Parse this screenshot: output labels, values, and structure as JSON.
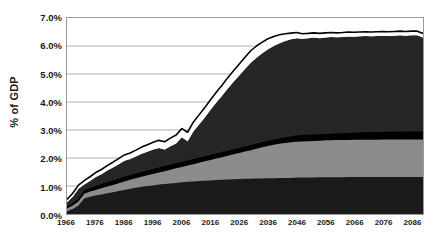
{
  "chart_data": {
    "type": "area",
    "title": "",
    "xlabel": "",
    "ylabel": "% of GDP",
    "xlim": [
      1966,
      2090
    ],
    "ylim": [
      0,
      0.07
    ],
    "grid": true,
    "legend": "none",
    "stacked": true,
    "y_tick_labels": [
      "7.0%",
      "6.0%",
      "5.0%",
      "4.0%",
      "3.0%",
      "2.0%",
      "1.0%",
      "0.0%"
    ],
    "y_tick_values": [
      7.0,
      6.0,
      5.0,
      4.0,
      3.0,
      2.0,
      1.0,
      0.0
    ],
    "x_tick_labels": [
      "1966",
      "1976",
      "1986",
      "1996",
      "2006",
      "2016",
      "2026",
      "2036",
      "2046",
      "2056",
      "2066",
      "2076",
      "2086"
    ],
    "x_tick_values": [
      1966,
      1976,
      1986,
      1996,
      2006,
      2016,
      2026,
      2036,
      2046,
      2056,
      2066,
      2076,
      2086
    ],
    "colors": {
      "layer1": "#1a1a1a",
      "layer2": "#8c8c8c",
      "layer3": "#000000",
      "layer4": "#262626",
      "gap": "#ffffff",
      "outline": "#000000",
      "gridline": "#9a9a9a",
      "axis": "#9a9a9a",
      "text": "#1a1a1a",
      "background": "#ffffff"
    },
    "x": [
      1966,
      1968,
      1970,
      1972,
      1974,
      1976,
      1978,
      1980,
      1982,
      1984,
      1986,
      1988,
      1990,
      1992,
      1994,
      1996,
      1998,
      2000,
      2002,
      2004,
      2006,
      2008,
      2010,
      2012,
      2014,
      2016,
      2018,
      2020,
      2022,
      2024,
      2026,
      2028,
      2030,
      2032,
      2034,
      2036,
      2038,
      2040,
      2042,
      2044,
      2046,
      2048,
      2050,
      2052,
      2054,
      2056,
      2058,
      2060,
      2062,
      2064,
      2066,
      2068,
      2070,
      2072,
      2074,
      2076,
      2078,
      2080,
      2082,
      2084,
      2086,
      2088,
      2090
    ],
    "series": [
      {
        "name": "layer1",
        "stack_top_values": [
          0.1,
          0.18,
          0.3,
          0.55,
          0.62,
          0.66,
          0.7,
          0.74,
          0.78,
          0.82,
          0.86,
          0.9,
          0.94,
          0.97,
          1.0,
          1.02,
          1.05,
          1.07,
          1.09,
          1.11,
          1.13,
          1.15,
          1.16,
          1.18,
          1.19,
          1.2,
          1.21,
          1.22,
          1.23,
          1.24,
          1.25,
          1.26,
          1.26,
          1.27,
          1.27,
          1.28,
          1.28,
          1.29,
          1.29,
          1.29,
          1.3,
          1.3,
          1.3,
          1.3,
          1.31,
          1.31,
          1.31,
          1.31,
          1.31,
          1.32,
          1.32,
          1.32,
          1.32,
          1.32,
          1.32,
          1.32,
          1.32,
          1.32,
          1.32,
          1.32,
          1.32,
          1.32,
          1.32
        ]
      },
      {
        "name": "layer2",
        "stack_top_values": [
          0.2,
          0.3,
          0.45,
          0.72,
          0.8,
          0.86,
          0.92,
          0.98,
          1.04,
          1.1,
          1.16,
          1.22,
          1.28,
          1.33,
          1.38,
          1.43,
          1.48,
          1.53,
          1.58,
          1.63,
          1.68,
          1.73,
          1.78,
          1.83,
          1.88,
          1.93,
          1.98,
          2.03,
          2.08,
          2.13,
          2.18,
          2.23,
          2.28,
          2.33,
          2.38,
          2.43,
          2.47,
          2.51,
          2.54,
          2.56,
          2.58,
          2.59,
          2.6,
          2.61,
          2.62,
          2.63,
          2.63,
          2.64,
          2.64,
          2.64,
          2.65,
          2.65,
          2.65,
          2.65,
          2.65,
          2.66,
          2.66,
          2.66,
          2.66,
          2.66,
          2.66,
          2.66,
          2.66
        ]
      },
      {
        "name": "layer3",
        "stack_top_values": [
          0.26,
          0.38,
          0.55,
          0.84,
          0.93,
          1.0,
          1.07,
          1.13,
          1.2,
          1.26,
          1.33,
          1.39,
          1.45,
          1.5,
          1.56,
          1.61,
          1.66,
          1.71,
          1.76,
          1.81,
          1.86,
          1.91,
          1.96,
          2.01,
          2.06,
          2.11,
          2.16,
          2.21,
          2.26,
          2.31,
          2.36,
          2.41,
          2.46,
          2.51,
          2.56,
          2.61,
          2.66,
          2.7,
          2.74,
          2.77,
          2.8,
          2.82,
          2.83,
          2.84,
          2.85,
          2.86,
          2.87,
          2.88,
          2.88,
          2.89,
          2.9,
          2.91,
          2.92,
          2.92,
          2.93,
          2.93,
          2.94,
          2.94,
          2.94,
          2.95,
          2.95,
          2.95,
          2.95
        ]
      },
      {
        "name": "layer4",
        "stack_top_values": [
          0.42,
          0.62,
          0.9,
          1.05,
          1.18,
          1.32,
          1.42,
          1.55,
          1.66,
          1.78,
          1.9,
          1.96,
          2.05,
          2.15,
          2.22,
          2.3,
          2.36,
          2.3,
          2.42,
          2.52,
          2.74,
          2.6,
          2.95,
          3.2,
          3.45,
          3.72,
          3.98,
          4.22,
          4.48,
          4.72,
          4.95,
          5.18,
          5.4,
          5.58,
          5.74,
          5.88,
          6.0,
          6.1,
          6.18,
          6.24,
          6.28,
          6.26,
          6.28,
          6.3,
          6.28,
          6.3,
          6.32,
          6.31,
          6.32,
          6.34,
          6.33,
          6.35,
          6.36,
          6.35,
          6.36,
          6.37,
          6.36,
          6.37,
          6.38,
          6.37,
          6.38,
          6.38,
          6.3
        ]
      },
      {
        "name": "total_outline",
        "stack_top_values": [
          0.52,
          0.74,
          1.03,
          1.19,
          1.33,
          1.48,
          1.59,
          1.73,
          1.85,
          1.98,
          2.11,
          2.18,
          2.28,
          2.39,
          2.47,
          2.56,
          2.63,
          2.58,
          2.71,
          2.82,
          3.05,
          2.92,
          3.28,
          3.54,
          3.8,
          4.08,
          4.35,
          4.6,
          4.87,
          5.12,
          5.36,
          5.6,
          5.83,
          6.0,
          6.14,
          6.26,
          6.34,
          6.4,
          6.44,
          6.46,
          6.48,
          6.44,
          6.45,
          6.47,
          6.45,
          6.47,
          6.48,
          6.47,
          6.48,
          6.5,
          6.49,
          6.5,
          6.51,
          6.5,
          6.51,
          6.52,
          6.51,
          6.52,
          6.53,
          6.52,
          6.53,
          6.53,
          6.45
        ]
      }
    ]
  }
}
